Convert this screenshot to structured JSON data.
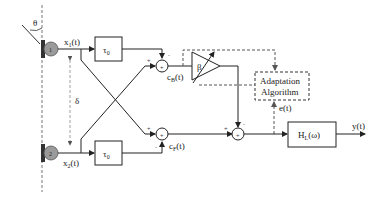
{
  "diagram": {
    "angle_label": "θ",
    "spacing_label": "δ",
    "mic1": {
      "label": "1",
      "signal": "x",
      "signal_sub": "1",
      "signal_arg": "(t)"
    },
    "mic2": {
      "label": "2",
      "signal": "x",
      "signal_sub": "2",
      "signal_arg": "(t)"
    },
    "delay1": {
      "label": "τ",
      "sub": "0"
    },
    "delay2": {
      "label": "τ",
      "sub": "0"
    },
    "sum_top": {
      "out": "c",
      "out_sub": "B",
      "out_arg": "(t)",
      "sign_delay": "-",
      "sign_cross": "+"
    },
    "sum_bottom": {
      "out": "c",
      "out_sub": "F",
      "out_arg": "(t)",
      "sign_delay": "-",
      "sign_cross": "+"
    },
    "gain": {
      "label": "β"
    },
    "sum_final": {
      "sign_top": "-",
      "sign_left": "+"
    },
    "adaptation": {
      "line1": "Adaptation",
      "line2": "Algorithm"
    },
    "error": {
      "label": "e(t)"
    },
    "filter": {
      "label": "H",
      "sub": "L",
      "arg": "(ω)"
    },
    "output": {
      "label": "y(t)"
    },
    "colors": {
      "line": "#222222",
      "mic_fill": "#9a9a9a",
      "dashed": "#555555"
    }
  }
}
